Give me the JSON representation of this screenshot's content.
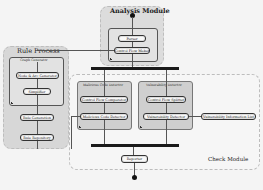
{
  "diagram": {
    "analysis_module": {
      "title": "Analysis Module",
      "nodes": [
        "Parser",
        "Control Flow Maker"
      ]
    },
    "rule_process": {
      "title": "Rule Process",
      "graph_generator": {
        "title": "Graph Generator",
        "nodes": [
          "Node & Arc Generator",
          "Simplifier"
        ]
      },
      "nodes": [
        "Rule Generation",
        "Rule Repository"
      ]
    },
    "check_module": {
      "title": "Check Module",
      "malicious_code_detector": {
        "title": "Malicious Code Detector",
        "nodes": [
          "Control Flow Comparator",
          "Malicious Code Detector"
        ]
      },
      "vulnerability_detector": {
        "title": "Vulnerability Detector",
        "nodes": [
          "Control Flow Splitter",
          "Vulnerability Detector"
        ]
      },
      "vulnerability_list": "Vulnerability Information List",
      "reporter": "Reporter"
    }
  }
}
